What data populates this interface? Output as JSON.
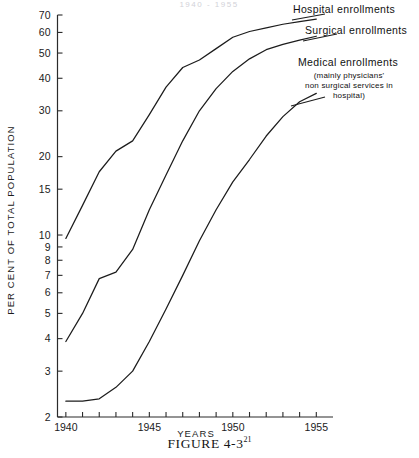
{
  "figure": {
    "caption_text": "FIGURE 4-3",
    "caption_superscript": "21",
    "top_title": "1940 - 1955"
  },
  "axes": {
    "y_axis_title": "PER CENT OF TOTAL POPULATION",
    "x_axis_title": "YEARS",
    "y_tick_labels": [
      "2",
      "3",
      "4",
      "5",
      "6",
      "7",
      "8",
      "9",
      "10",
      "15",
      "20",
      "30",
      "40",
      "50",
      "60",
      "70"
    ],
    "x_tick_labels": [
      "1940",
      "1945",
      "1950",
      "1955"
    ]
  },
  "legend": {
    "hospital_label": "Hospital enrollments",
    "surgical_label": "Surgical enrollments",
    "medical_label": "Medical enrollments",
    "medical_sub_line1": "(mainly physicians'",
    "medical_sub_line2": "non surgical services in",
    "medical_sub_line3": "hospital)"
  },
  "chart_data": {
    "type": "line",
    "title": "1940 - 1955",
    "xlabel": "YEARS",
    "ylabel": "PER CENT OF TOTAL POPULATION",
    "yscale": "log",
    "ylim": [
      2,
      70
    ],
    "xlim": [
      1939.5,
      1956
    ],
    "grid": false,
    "legend_position": "right-inline-labels",
    "yticks": [
      2,
      3,
      4,
      5,
      6,
      7,
      8,
      9,
      10,
      15,
      20,
      30,
      40,
      50,
      60,
      70
    ],
    "xticks": [
      1940,
      1945,
      1950,
      1955
    ],
    "x_minor_ticks": [
      1940,
      1941,
      1942,
      1943,
      1944,
      1945,
      1946,
      1947,
      1948,
      1949,
      1950,
      1951,
      1952,
      1953,
      1954,
      1955
    ],
    "x": [
      1940,
      1941,
      1942,
      1943,
      1944,
      1945,
      1946,
      1947,
      1948,
      1949,
      1950,
      1951,
      1952,
      1953,
      1954,
      1955
    ],
    "series": [
      {
        "name": "Hospital enrollments",
        "color": "#1c1c1c",
        "values": [
          9.7,
          13.0,
          17.5,
          21.0,
          23.0,
          29.0,
          37.0,
          44.0,
          47.0,
          52.0,
          57.5,
          60.5,
          62.5,
          64.5,
          66.0,
          67.5
        ]
      },
      {
        "name": "Surgical enrollments",
        "color": "#1c1c1c",
        "values": [
          3.9,
          5.0,
          6.8,
          7.2,
          8.8,
          12.5,
          17.0,
          23.0,
          30.0,
          36.5,
          42.5,
          47.5,
          51.5,
          54.0,
          56.0,
          58.0
        ]
      },
      {
        "name": "Medical enrollments (mainly physicians' non surgical services in hospital)",
        "color": "#1c1c1c",
        "values": [
          2.3,
          2.3,
          2.35,
          2.6,
          3.0,
          3.9,
          5.2,
          7.0,
          9.5,
          12.5,
          16.0,
          19.5,
          24.0,
          28.5,
          32.5,
          35.0
        ]
      }
    ]
  }
}
